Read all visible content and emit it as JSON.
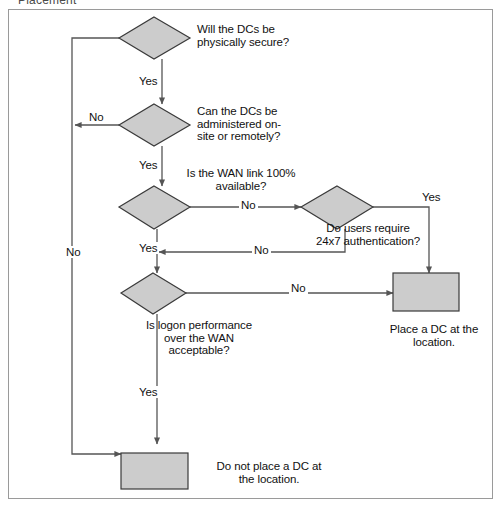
{
  "caption": "Placement",
  "diagram": {
    "shape_fill": "#cccccc",
    "shape_stroke": "#3a3a3a",
    "line_color": "#555555",
    "frame_color": "#9a9a9a",
    "nodes": [
      {
        "id": "q1",
        "type": "decision",
        "label": "Will the DCs be\nphysically secure?",
        "x": 118,
        "y": 16,
        "w": 70,
        "h": 42,
        "label_x": 196,
        "label_y": 22,
        "label_w": 150,
        "label_align": "left"
      },
      {
        "id": "q2",
        "type": "decision",
        "label": "Can the DCs be\nadministered on-\nsite or remotely?",
        "x": 118,
        "y": 103,
        "w": 70,
        "h": 42,
        "label_x": 196,
        "label_y": 103,
        "label_w": 150,
        "label_align": "left"
      },
      {
        "id": "q3",
        "type": "decision",
        "label": "Is the WAN link 100%\navailable?",
        "x": 114,
        "y": 185,
        "w": 75,
        "h": 43,
        "label_x": 160,
        "label_y": 166,
        "label_w": 160,
        "label_align": "center"
      },
      {
        "id": "q4",
        "type": "decision",
        "label": "Do users require\n24x7 authentication?",
        "x": 300,
        "y": 185,
        "w": 72,
        "h": 42,
        "label_x": 292,
        "label_y": 221,
        "label_w": 150,
        "label_align": "center"
      },
      {
        "id": "q5",
        "type": "decision",
        "label": "Is logon performance\nover the WAN\nacceptable?",
        "x": 112,
        "y": 272,
        "w": 73,
        "h": 40,
        "label_x": 120,
        "label_y": 318,
        "label_w": 156,
        "label_align": "center"
      },
      {
        "id": "r1",
        "type": "terminal",
        "label": "Place a DC at the\nlocation.",
        "x": 400,
        "y": 272,
        "w": 65,
        "h": 38,
        "label_x": 380,
        "label_y": 322,
        "label_w": 106,
        "label_align": "center"
      },
      {
        "id": "r2",
        "type": "terminal",
        "label": "Do not place a DC at\nthe location.",
        "x": 121,
        "y": 452,
        "w": 66,
        "h": 36,
        "label_x": 198,
        "label_y": 459,
        "label_w": 140,
        "label_align": "left"
      }
    ],
    "edges": [
      {
        "id": "e-q1-no",
        "label": "No",
        "label_x": 86,
        "label_y": 110
      },
      {
        "id": "e-q1-yes",
        "label": "Yes",
        "label_x": 136,
        "label_y": 74
      },
      {
        "id": "e-q2-yes",
        "label": "Yes",
        "label_x": 136,
        "label_y": 158
      },
      {
        "id": "e-q3-no",
        "label": "No",
        "label_x": 238,
        "label_y": 198
      },
      {
        "id": "e-q3-yes",
        "label": "Yes",
        "label_x": 136,
        "label_y": 241
      },
      {
        "id": "e-q4-yes",
        "label": "Yes",
        "label_x": 419,
        "label_y": 190
      },
      {
        "id": "e-q4-no",
        "label": "No",
        "label_x": 251,
        "label_y": 245
      },
      {
        "id": "e-q5-no",
        "label": "No",
        "label_x": 288,
        "label_y": 279
      },
      {
        "id": "e-q5-yes",
        "label": "Yes",
        "label_x": 136,
        "label_y": 385
      },
      {
        "id": "e-return",
        "label": "No",
        "label_x": 69,
        "label_y": 245
      }
    ]
  }
}
